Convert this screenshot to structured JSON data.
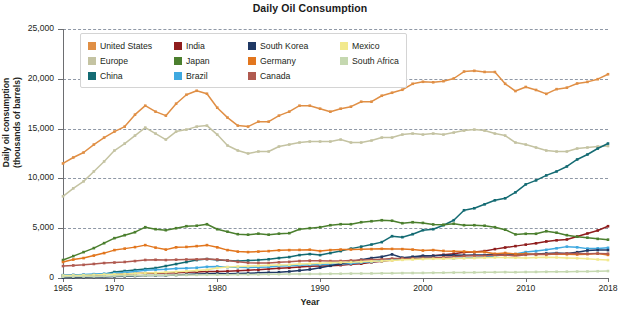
{
  "chart_data": {
    "type": "line",
    "title": "Daily Oil Consumption",
    "xlabel": "Year",
    "ylabel": "Daily oil consumption (thousands of barrels)",
    "ylabel_line1": "Daily oil consumption",
    "ylabel_line2": "(thousands of barrels)",
    "xlim": [
      1965,
      2018
    ],
    "ylim": [
      0,
      25000
    ],
    "grid": "horizontal-dashed",
    "legend_position": "top-left-inside",
    "ytick_labels": [
      "0",
      "5,000",
      "10,000",
      "15,000",
      "20,000",
      "25,000"
    ],
    "ytick_values": [
      0,
      5000,
      10000,
      15000,
      20000,
      25000
    ],
    "xtick_labels": [
      "1965",
      "1970",
      "1980",
      "1990",
      "2000",
      "2010",
      "2018"
    ],
    "xtick_values": [
      1965,
      1970,
      1980,
      1990,
      2000,
      2010,
      2018
    ],
    "x": [
      1965,
      1966,
      1967,
      1968,
      1969,
      1970,
      1971,
      1972,
      1973,
      1974,
      1975,
      1976,
      1977,
      1978,
      1979,
      1980,
      1981,
      1982,
      1983,
      1984,
      1985,
      1986,
      1987,
      1988,
      1989,
      1990,
      1991,
      1992,
      1993,
      1994,
      1995,
      1996,
      1997,
      1998,
      1999,
      2000,
      2001,
      2002,
      2003,
      2004,
      2005,
      2006,
      2007,
      2008,
      2009,
      2010,
      2011,
      2012,
      2013,
      2014,
      2015,
      2016,
      2017,
      2018
    ],
    "series": [
      {
        "name": "United States",
        "color": "#e08f45",
        "values": [
          11500,
          12100,
          12600,
          13400,
          14100,
          14700,
          15200,
          16400,
          17300,
          16700,
          16300,
          17500,
          18400,
          18800,
          18500,
          17100,
          16100,
          15300,
          15200,
          15700,
          15700,
          16300,
          16700,
          17300,
          17300,
          17000,
          16700,
          17000,
          17200,
          17700,
          17700,
          18300,
          18600,
          18900,
          19500,
          19700,
          19650,
          19760,
          20030,
          20730,
          20800,
          20690,
          20680,
          19500,
          18770,
          19180,
          18880,
          18490,
          18960,
          19110,
          19530,
          19690,
          19960,
          20460
        ]
      },
      {
        "name": "Europe",
        "color": "#c4c3a2",
        "values": [
          8200,
          9000,
          9700,
          10700,
          11700,
          12800,
          13500,
          14300,
          15100,
          14500,
          13900,
          14700,
          14900,
          15200,
          15300,
          14400,
          13300,
          12800,
          12500,
          12700,
          12700,
          13200,
          13400,
          13600,
          13700,
          13700,
          13700,
          13900,
          13600,
          13600,
          13800,
          14100,
          14100,
          14400,
          14500,
          14400,
          14500,
          14400,
          14600,
          14800,
          14900,
          14800,
          14500,
          14300,
          13600,
          13400,
          13100,
          12800,
          12700,
          12700,
          13000,
          13100,
          13200,
          13250
        ]
      },
      {
        "name": "China",
        "color": "#146b73",
        "values": [
          230,
          280,
          250,
          300,
          380,
          600,
          700,
          800,
          900,
          1000,
          1200,
          1400,
          1600,
          1800,
          1900,
          1800,
          1750,
          1700,
          1750,
          1800,
          1880,
          2000,
          2100,
          2300,
          2400,
          2300,
          2500,
          2700,
          2950,
          3150,
          3360,
          3600,
          4200,
          4100,
          4400,
          4800,
          4900,
          5300,
          5800,
          6800,
          7000,
          7400,
          7800,
          8000,
          8600,
          9400,
          9800,
          10300,
          10700,
          11200,
          11900,
          12400,
          13000,
          13500
        ]
      },
      {
        "name": "India",
        "color": "#8f1d1d",
        "values": [
          260,
          280,
          300,
          330,
          360,
          390,
          410,
          440,
          470,
          480,
          500,
          530,
          570,
          610,
          650,
          660,
          690,
          730,
          780,
          830,
          900,
          980,
          1030,
          1100,
          1180,
          1210,
          1230,
          1290,
          1370,
          1440,
          1570,
          1680,
          1800,
          1900,
          2000,
          2200,
          2230,
          2330,
          2430,
          2580,
          2600,
          2700,
          2900,
          3060,
          3200,
          3350,
          3480,
          3670,
          3780,
          3870,
          4160,
          4470,
          4770,
          5200
        ]
      },
      {
        "name": "Japan",
        "color": "#4b7f2e",
        "values": [
          1800,
          2200,
          2600,
          3000,
          3500,
          4000,
          4300,
          4600,
          5100,
          4900,
          4800,
          5000,
          5200,
          5250,
          5400,
          4900,
          4650,
          4400,
          4350,
          4450,
          4350,
          4450,
          4500,
          4900,
          5000,
          5100,
          5300,
          5400,
          5400,
          5600,
          5700,
          5800,
          5750,
          5500,
          5600,
          5530,
          5380,
          5350,
          5450,
          5300,
          5300,
          5250,
          5100,
          4850,
          4380,
          4440,
          4440,
          4700,
          4550,
          4300,
          4150,
          4050,
          3930,
          3850
        ]
      },
      {
        "name": "Brazil",
        "color": "#3fa9e0",
        "values": [
          290,
          310,
          340,
          390,
          430,
          480,
          560,
          650,
          780,
          830,
          870,
          950,
          980,
          1030,
          1120,
          1150,
          1080,
          1080,
          1060,
          1080,
          1110,
          1200,
          1240,
          1290,
          1320,
          1350,
          1380,
          1400,
          1450,
          1550,
          1620,
          1720,
          1850,
          1960,
          2020,
          2050,
          2040,
          2000,
          1960,
          2020,
          2060,
          2100,
          2200,
          2350,
          2400,
          2600,
          2700,
          2830,
          2980,
          3150,
          3080,
          2950,
          2970,
          3030
        ]
      },
      {
        "name": "South Korea",
        "color": "#1f3864",
        "values": [
          40,
          50,
          70,
          90,
          110,
          140,
          170,
          200,
          240,
          240,
          260,
          300,
          340,
          390,
          430,
          440,
          430,
          440,
          470,
          520,
          540,
          580,
          650,
          750,
          860,
          1030,
          1230,
          1430,
          1640,
          1840,
          2000,
          2130,
          2370,
          2040,
          2140,
          2230,
          2230,
          2290,
          2300,
          2280,
          2320,
          2300,
          2380,
          2290,
          2330,
          2390,
          2400,
          2460,
          2500,
          2460,
          2590,
          2760,
          2800,
          2800
        ]
      },
      {
        "name": "Germany",
        "color": "#e2761e",
        "values": [
          1600,
          1850,
          2000,
          2250,
          2500,
          2800,
          2950,
          3100,
          3300,
          3050,
          2850,
          3080,
          3120,
          3200,
          3300,
          3080,
          2800,
          2650,
          2600,
          2650,
          2700,
          2780,
          2800,
          2820,
          2840,
          2700,
          2800,
          2850,
          2860,
          2880,
          2900,
          2930,
          2920,
          2900,
          2850,
          2760,
          2800,
          2720,
          2680,
          2660,
          2620,
          2620,
          2430,
          2510,
          2410,
          2440,
          2370,
          2370,
          2420,
          2380,
          2360,
          2390,
          2450,
          2320
        ]
      },
      {
        "name": "Canada",
        "color": "#b05a50",
        "values": [
          1200,
          1260,
          1320,
          1410,
          1500,
          1550,
          1610,
          1700,
          1810,
          1830,
          1800,
          1840,
          1860,
          1870,
          1900,
          1850,
          1760,
          1620,
          1520,
          1500,
          1500,
          1570,
          1620,
          1700,
          1740,
          1740,
          1700,
          1710,
          1760,
          1800,
          1830,
          1880,
          1950,
          1970,
          1980,
          2020,
          2020,
          2080,
          2130,
          2210,
          2240,
          2230,
          2290,
          2310,
          2200,
          2330,
          2390,
          2380,
          2440,
          2460,
          2450,
          2440,
          2450,
          2440
        ]
      },
      {
        "name": "Mexico",
        "color": "#f2e98d",
        "values": [
          240,
          260,
          280,
          310,
          340,
          370,
          400,
          440,
          490,
          530,
          580,
          620,
          680,
          750,
          820,
          1000,
          1100,
          1150,
          1180,
          1230,
          1280,
          1300,
          1320,
          1400,
          1440,
          1480,
          1520,
          1560,
          1590,
          1620,
          1670,
          1700,
          1760,
          1820,
          1860,
          1900,
          1930,
          1940,
          1960,
          1980,
          2000,
          2030,
          2060,
          2050,
          2030,
          2020,
          2050,
          2080,
          2060,
          2010,
          1980,
          1940,
          1860,
          1800
        ]
      },
      {
        "name": "South Africa",
        "color": "#c5d8b0",
        "values": [
          130,
          140,
          150,
          160,
          180,
          200,
          220,
          240,
          260,
          270,
          280,
          290,
          300,
          310,
          320,
          330,
          330,
          340,
          350,
          360,
          370,
          380,
          390,
          400,
          410,
          410,
          420,
          430,
          440,
          450,
          460,
          470,
          480,
          490,
          500,
          510,
          520,
          530,
          540,
          550,
          560,
          570,
          580,
          590,
          580,
          600,
          610,
          620,
          630,
          640,
          650,
          660,
          680,
          700
        ]
      }
    ]
  },
  "legend": {
    "items": [
      {
        "label": "United States",
        "color": "#e08f45"
      },
      {
        "label": "India",
        "color": "#8f1d1d"
      },
      {
        "label": "South Korea",
        "color": "#1f3864"
      },
      {
        "label": "Mexico",
        "color": "#f2e98d"
      },
      {
        "label": "Europe",
        "color": "#c4c3a2"
      },
      {
        "label": "Japan",
        "color": "#4b7f2e"
      },
      {
        "label": "Germany",
        "color": "#e2761e"
      },
      {
        "label": "South Africa",
        "color": "#c5d8b0"
      },
      {
        "label": "China",
        "color": "#146b73"
      },
      {
        "label": "Brazil",
        "color": "#3fa9e0"
      },
      {
        "label": "Canada",
        "color": "#b05a50"
      }
    ]
  }
}
